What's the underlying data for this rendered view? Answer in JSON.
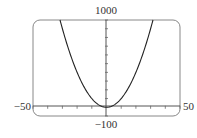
{
  "chart_data": {
    "type": "line",
    "title": "",
    "function": "y = x^2",
    "xlabel": "",
    "ylabel": "",
    "xlim": [
      -50,
      50
    ],
    "ylim": [
      -100,
      1000
    ],
    "x_tick_spacing": 10,
    "y_tick_spacing": 100,
    "grid": false,
    "series": [
      {
        "name": "y = x^2",
        "x": [
          -31.6,
          -30,
          -25,
          -20,
          -15,
          -10,
          -5,
          0,
          5,
          10,
          15,
          20,
          25,
          30,
          31.6
        ],
        "y": [
          1000,
          900,
          625,
          400,
          225,
          100,
          25,
          0,
          25,
          100,
          225,
          400,
          625,
          900,
          1000
        ]
      }
    ],
    "labels": {
      "y_max": "1000",
      "y_min": "−100",
      "x_min": "−50",
      "x_max": "50"
    }
  }
}
